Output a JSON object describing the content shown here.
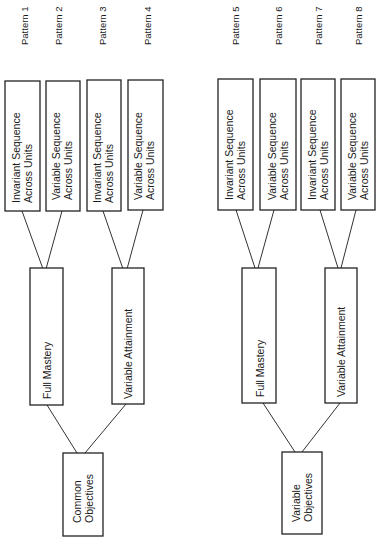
{
  "diagram": {
    "orientation": "rotated-90-ccw",
    "trees": [
      {
        "root": {
          "label_lines": [
            "Common",
            "Objectives"
          ]
        },
        "branches": [
          {
            "label": "Full Mastery",
            "leaves": [
              {
                "label_lines": [
                  "Invariant Sequence",
                  "Across Units"
                ],
                "pattern": "Pattern 1"
              },
              {
                "label_lines": [
                  "Variable Sequence",
                  "Across Units"
                ],
                "pattern": "Pattern 2"
              }
            ]
          },
          {
            "label": "Variable Attainment",
            "leaves": [
              {
                "label_lines": [
                  "Invariant Sequence",
                  "Across Units"
                ],
                "pattern": "Pattern 3"
              },
              {
                "label_lines": [
                  "Variable Sequence",
                  "Across Units"
                ],
                "pattern": "Pattern 4"
              }
            ]
          }
        ]
      },
      {
        "root": {
          "label_lines": [
            "Variable",
            "Objectives"
          ]
        },
        "branches": [
          {
            "label": "Full Mastery",
            "leaves": [
              {
                "label_lines": [
                  "Invariant Sequence",
                  "Across Units"
                ],
                "pattern": "Pattern 5"
              },
              {
                "label_lines": [
                  "Variable Sequence",
                  "Across Units"
                ],
                "pattern": "Pattern 6"
              }
            ]
          },
          {
            "label": "Variable Attainment",
            "leaves": [
              {
                "label_lines": [
                  "Invariant Sequence",
                  "Across Units"
                ],
                "pattern": "Pattern 7"
              },
              {
                "label_lines": [
                  "Variable Sequence",
                  "Across Units"
                ],
                "pattern": "Pattern 8"
              }
            ]
          }
        ]
      }
    ]
  }
}
